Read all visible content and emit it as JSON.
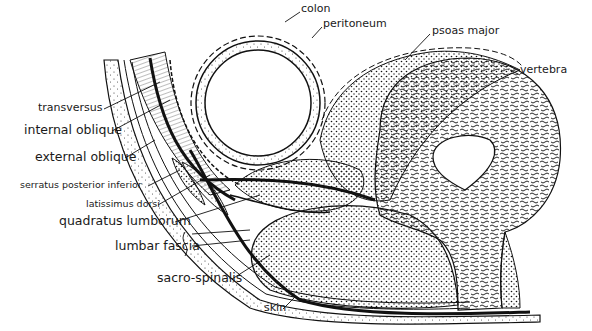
{
  "diagram": {
    "labels": {
      "colon": "colon",
      "peritoneum": "peritoneum",
      "psoas_major": "psoas major",
      "vertebra": "vertebra",
      "transversus": "transversus",
      "internal_oblique": "internal oblique",
      "external_oblique": "external oblique",
      "serratus_posterior_inferior": "serratus posterior inferior",
      "latissimus_dorsi": "latissimus dorsi",
      "quadratus_lumborum": "quadratus lumborum",
      "lumbar_fascia": "lumbar fascia",
      "sacro_spinalis": "sacro-spinalis",
      "skin": "skin"
    },
    "colors": {
      "ink": "#111111",
      "paper": "#ffffff"
    }
  }
}
